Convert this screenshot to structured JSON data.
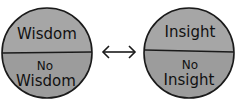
{
  "left_circle": {
    "top_label": "Wisdom",
    "bottom_label_line1": "No",
    "bottom_label_line2": "Wisdom"
  },
  "right_circle": {
    "top_label": "Insight",
    "bottom_label_line1": "No",
    "bottom_label_line2": "Insight"
  },
  "connector": {
    "icon": "double-headed-arrow"
  },
  "colors": {
    "top_fill": "#a6a6a6",
    "bottom_fill": "#9c9c9c",
    "stroke": "#1a1a1a",
    "background": "#ffffff"
  }
}
